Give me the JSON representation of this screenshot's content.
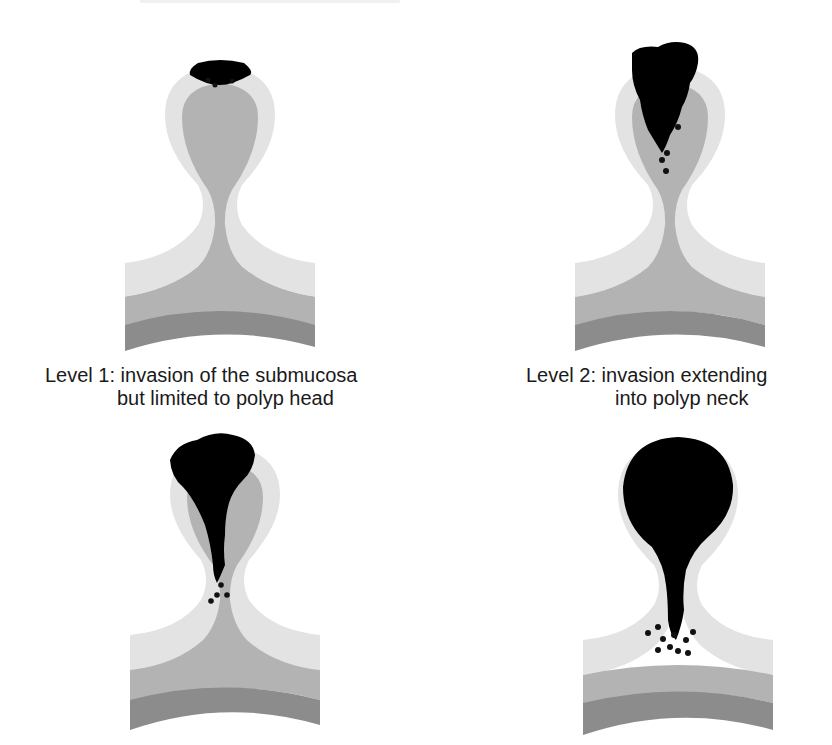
{
  "figure": {
    "colors": {
      "background": "#ffffff",
      "mucosa": "#e3e3e3",
      "submucosa": "#b3b3b3",
      "muscularis": "#8c8c8c",
      "tumor": "#000000",
      "text": "#1a1a1a"
    },
    "panels": [
      {
        "id": "level-1",
        "level": 1,
        "caption_line1": "Level 1: invasion of the submucosa",
        "caption_line2": "but limited to polyp head"
      },
      {
        "id": "level-2",
        "level": 2,
        "caption_line1": "Level 2: invasion extending",
        "caption_line2": "into polyp neck"
      },
      {
        "id": "level-3",
        "level": 3,
        "caption_line1": "",
        "caption_line2": ""
      },
      {
        "id": "level-4",
        "level": 4,
        "caption_line1": "",
        "caption_line2": ""
      }
    ]
  }
}
